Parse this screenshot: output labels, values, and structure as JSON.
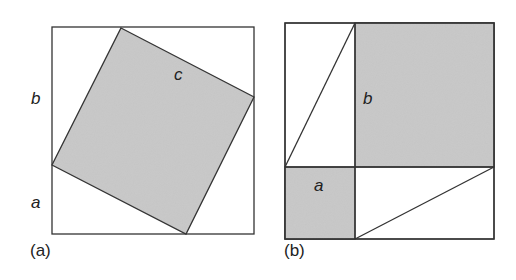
{
  "colors": {
    "fill": "#c8c8c8",
    "stroke": "#333333"
  },
  "figure_a": {
    "caption": "(a)",
    "labels": {
      "b": "b",
      "a": "a",
      "c": "c"
    }
  },
  "figure_b": {
    "caption": "(b)",
    "labels": {
      "b": "b",
      "a": "a"
    }
  }
}
